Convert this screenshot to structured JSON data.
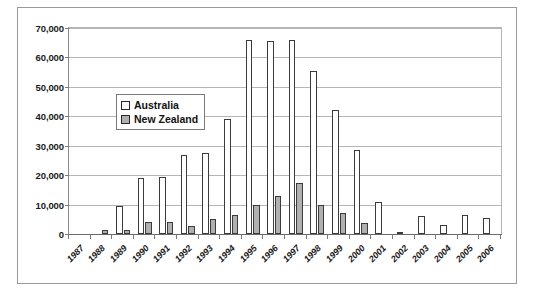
{
  "chart_data": {
    "type": "bar",
    "title": "",
    "subtitle": "",
    "xlabel": "",
    "ylabel": "",
    "ylim": [
      0,
      70000
    ],
    "ytick_values": [
      0,
      10000,
      20000,
      30000,
      40000,
      50000,
      60000,
      70000
    ],
    "ytick_labels": [
      "0",
      "10,000",
      "20,000",
      "30,000",
      "40,000",
      "50,000",
      "60,000",
      "70,000"
    ],
    "grid": true,
    "legend_position": "inside-upper-left",
    "categories": [
      "1987",
      "1988",
      "1989",
      "1990",
      "1991",
      "1992",
      "1993",
      "1994",
      "1995",
      "1996",
      "1997",
      "1998",
      "1999",
      "2000",
      "2001",
      "2002",
      "2003",
      "2004",
      "2005",
      "2006"
    ],
    "series": [
      {
        "name": "Australia",
        "color": "#ffffff",
        "border_color": "#3b3b3b",
        "values": [
          0,
          0,
          9500,
          19000,
          19500,
          27000,
          27500,
          39000,
          66000,
          65500,
          66000,
          55500,
          42000,
          28500,
          11000,
          300,
          6000,
          3000,
          6500,
          5500
        ]
      },
      {
        "name": "New Zealand",
        "color": "#b0b0b0",
        "border_color": "#3b3b3b",
        "values": [
          0,
          1200,
          1300,
          4200,
          4000,
          2800,
          5000,
          6500,
          9800,
          13000,
          17500,
          9800,
          7000,
          3600,
          0,
          0,
          0,
          0,
          0,
          0
        ]
      }
    ]
  },
  "legend": {
    "items": [
      {
        "label": "Australia",
        "swatch": "au"
      },
      {
        "label": "New Zealand",
        "swatch": "nz"
      }
    ]
  },
  "colors": {
    "frame_border": "#9a9a9a",
    "gridline": "#b5b5b5",
    "axis": "#6a6a6a",
    "australia_fill": "#ffffff",
    "new_zealand_fill": "#b0b0b0",
    "bar_outline": "#3b3b3b",
    "text": "#1a1a1a"
  }
}
